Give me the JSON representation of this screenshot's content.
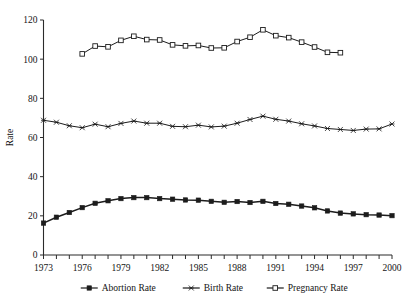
{
  "chart_data": {
    "type": "line",
    "title": "",
    "xlabel": "",
    "ylabel": "Rate",
    "xlim": [
      1973,
      2000
    ],
    "ylim": [
      0,
      120
    ],
    "grid": false,
    "legend_position": "bottom",
    "x_tick_labels": [
      "1973",
      "1976",
      "1979",
      "1982",
      "1985",
      "1988",
      "1991",
      "1994",
      "1997",
      "2000"
    ],
    "x_tick_values": [
      1973,
      1976,
      1979,
      1982,
      1985,
      1988,
      1991,
      1994,
      1997,
      2000
    ],
    "x_minor_tick_values": [
      1973,
      1974,
      1975,
      1976,
      1977,
      1978,
      1979,
      1980,
      1981,
      1982,
      1983,
      1984,
      1985,
      1986,
      1987,
      1988,
      1989,
      1990,
      1991,
      1992,
      1993,
      1994,
      1995,
      1996,
      1997,
      1998,
      1999,
      2000
    ],
    "y_tick_labels": [
      "0",
      "20",
      "40",
      "60",
      "80",
      "100",
      "120"
    ],
    "y_tick_values": [
      0,
      20,
      40,
      60,
      80,
      100,
      120
    ],
    "categories": [
      1973,
      1974,
      1975,
      1976,
      1977,
      1978,
      1979,
      1980,
      1981,
      1982,
      1983,
      1984,
      1985,
      1986,
      1987,
      1988,
      1989,
      1990,
      1991,
      1992,
      1993,
      1994,
      1995,
      1996,
      1997,
      1998,
      1999,
      2000
    ],
    "series": [
      {
        "name": "Abortion Rate",
        "marker": "filled-square",
        "color": "#1c1c1c",
        "x": [
          1973,
          1974,
          1975,
          1976,
          1977,
          1978,
          1979,
          1980,
          1981,
          1982,
          1983,
          1984,
          1985,
          1986,
          1987,
          1988,
          1989,
          1990,
          1991,
          1992,
          1993,
          1994,
          1995,
          1996,
          1997,
          1998,
          1999,
          2000
        ],
        "values": [
          16.3,
          19.3,
          21.7,
          24.2,
          26.4,
          27.7,
          28.8,
          29.3,
          29.3,
          28.8,
          28.5,
          28.1,
          28.0,
          27.4,
          26.9,
          27.3,
          26.8,
          27.4,
          26.3,
          25.9,
          25.0,
          24.1,
          22.5,
          21.4,
          21.0,
          20.6,
          20.4,
          20.1
        ],
        "units": "per 1,000 women aged 15-44"
      },
      {
        "name": "Birth Rate",
        "marker": "star",
        "color": "#1c1c1c",
        "x": [
          1973,
          1974,
          1975,
          1976,
          1977,
          1978,
          1979,
          1980,
          1981,
          1982,
          1983,
          1984,
          1985,
          1986,
          1987,
          1988,
          1989,
          1990,
          1991,
          1992,
          1993,
          1994,
          1995,
          1996,
          1997,
          1998,
          1999,
          2000
        ],
        "values": [
          68.8,
          67.8,
          66.0,
          65.0,
          66.8,
          65.5,
          67.2,
          68.4,
          67.3,
          67.3,
          65.7,
          65.5,
          66.3,
          65.4,
          65.8,
          67.3,
          69.2,
          70.9,
          69.3,
          68.4,
          67.0,
          65.9,
          64.6,
          64.1,
          63.6,
          64.3,
          64.4,
          66.9
        ]
      },
      {
        "name": "Pregnancy Rate",
        "marker": "open-square",
        "color": "#1c1c1c",
        "x": [
          1976,
          1977,
          1978,
          1979,
          1980,
          1981,
          1982,
          1983,
          1984,
          1985,
          1986,
          1987,
          1988,
          1989,
          1990,
          1991,
          1992,
          1993,
          1994,
          1995,
          1996
        ],
        "values": [
          102.7,
          106.7,
          106.3,
          109.6,
          111.7,
          110.0,
          109.8,
          107.3,
          106.8,
          107.0,
          105.7,
          105.8,
          109.0,
          111.2,
          115.0,
          112.0,
          111.0,
          108.7,
          106.2,
          103.5,
          103.3
        ]
      }
    ]
  },
  "legend": {
    "items": [
      {
        "label": "Abortion Rate",
        "marker": "filled-square"
      },
      {
        "label": "Birth Rate",
        "marker": "star"
      },
      {
        "label": "Pregnancy Rate",
        "marker": "open-square"
      }
    ]
  }
}
